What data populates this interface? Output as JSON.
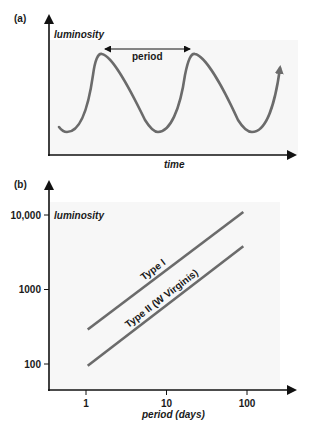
{
  "chart_data": [
    {
      "panel": "(a)",
      "type": "line",
      "title": "",
      "xlabel": "time",
      "ylabel": "luminosity",
      "annotation": "period",
      "description": "Periodic light curve of a Cepheid variable: sharp rise to maximum, slower decline to minimum",
      "series": [
        {
          "name": "light curve",
          "cycles": 2.5,
          "x": [
            0.0,
            0.2,
            0.4,
            0.6,
            0.8,
            1.0,
            1.2,
            1.4,
            1.6,
            1.8,
            2.0,
            2.2,
            2.4,
            2.6
          ],
          "y": [
            0.05,
            0.55,
            1.0,
            0.7,
            0.35,
            0.0,
            0.55,
            1.0,
            0.7,
            0.35,
            0.0,
            0.3,
            0.7,
            0.9
          ]
        }
      ],
      "grid": false
    },
    {
      "panel": "(b)",
      "type": "line",
      "title": "",
      "xlabel": "period (days)",
      "ylabel": "luminosity",
      "xscale": "log",
      "yscale": "log",
      "xticks": [
        1,
        10,
        100
      ],
      "xtick_labels": [
        "1",
        "10",
        "100"
      ],
      "yticks": [
        100,
        1000,
        10000
      ],
      "ytick_labels": [
        "100",
        "1000",
        "10,000"
      ],
      "xlim": [
        0.35,
        300
      ],
      "ylim": [
        40,
        20000
      ],
      "series": [
        {
          "name": "Type I",
          "x": [
            1.05,
            90
          ],
          "y": [
            290,
            11000
          ]
        },
        {
          "name": "Type II (W Virginis)",
          "x": [
            1.05,
            90
          ],
          "y": [
            95,
            3800
          ]
        }
      ],
      "grid": false
    }
  ]
}
